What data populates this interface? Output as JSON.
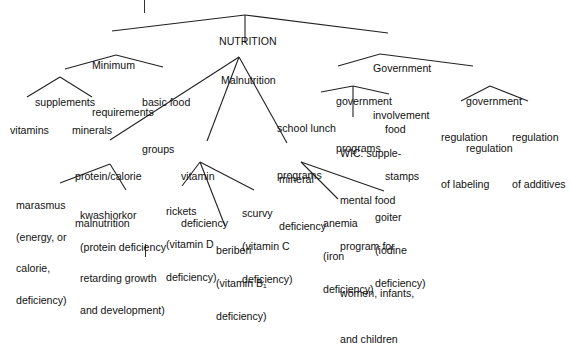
{
  "diagram": {
    "type": "concept-map",
    "root": {
      "id": "nutrition",
      "lines": [
        "NUTRITION"
      ]
    },
    "nodes": [
      {
        "id": "min-req",
        "parent": "nutrition",
        "lines": [
          "Minimum",
          "requirements"
        ]
      },
      {
        "id": "malnutrition",
        "parent": "nutrition",
        "lines": [
          "Malnutrition"
        ]
      },
      {
        "id": "gov-inv",
        "parent": "nutrition",
        "lines": [
          "Government",
          "involvement"
        ]
      },
      {
        "id": "supplements",
        "parent": "min-req",
        "lines": [
          "supplements"
        ]
      },
      {
        "id": "basic-food",
        "parent": "min-req",
        "lines": [
          "basic food",
          "groups"
        ]
      },
      {
        "id": "vitamins",
        "parent": "supplements",
        "lines": [
          "vitamins"
        ]
      },
      {
        "id": "minerals",
        "parent": "supplements",
        "lines": [
          "minerals"
        ]
      },
      {
        "id": "gov-prog",
        "parent": "gov-inv",
        "lines": [
          "government",
          "programs"
        ]
      },
      {
        "id": "gov-reg",
        "parent": "gov-inv",
        "lines": [
          "government",
          "regulation"
        ]
      },
      {
        "id": "school-lunch",
        "parent": "gov-prog",
        "lines": [
          "school lunch",
          "programs"
        ]
      },
      {
        "id": "wic",
        "parent": "gov-prog",
        "lines": [
          "WIC: supple-",
          "mental food",
          "program for",
          "women, infants,",
          "and children"
        ]
      },
      {
        "id": "food-stamps",
        "parent": "gov-prog",
        "lines": [
          "food",
          "stamps"
        ]
      },
      {
        "id": "reg-labeling",
        "parent": "gov-reg",
        "lines": [
          "regulation",
          "of labeling"
        ]
      },
      {
        "id": "reg-additives",
        "parent": "gov-reg",
        "lines": [
          "regulation",
          "of additives"
        ]
      },
      {
        "id": "protein-cal",
        "parent": "malnutrition",
        "lines": [
          "protein/calorie",
          "malnutrition"
        ]
      },
      {
        "id": "vitamin-def",
        "parent": "malnutrition",
        "lines": [
          "vitamin",
          "deficiency"
        ]
      },
      {
        "id": "mineral-def",
        "parent": "malnutrition",
        "lines": [
          "mineral",
          "deficiency"
        ]
      },
      {
        "id": "marasmus",
        "parent": "protein-cal",
        "lines": [
          "marasmus",
          "(energy, or",
          "calorie,",
          "deficiency)"
        ]
      },
      {
        "id": "kwashiorkor",
        "parent": "protein-cal",
        "lines": [
          "kwashiorkor",
          "(protein deficiency",
          "retarding growth",
          "and development)"
        ]
      },
      {
        "id": "rickets",
        "parent": "vitamin-def",
        "lines": [
          "rickets",
          "(vitamin D",
          "deficiency)"
        ]
      },
      {
        "id": "beriberi",
        "parent": "vitamin-def",
        "lines": [
          "beriberi",
          "(vitamin B₁",
          "deficiency)"
        ]
      },
      {
        "id": "scurvy",
        "parent": "vitamin-def",
        "lines": [
          "scurvy",
          "(vitamin C",
          "deficiency)"
        ]
      },
      {
        "id": "anemia",
        "parent": "mineral-def",
        "lines": [
          "anemia",
          "(iron",
          "deficiency)"
        ]
      },
      {
        "id": "goiter",
        "parent": "mineral-def",
        "lines": [
          "goiter",
          "(iodine",
          "deficiency)"
        ]
      }
    ]
  }
}
